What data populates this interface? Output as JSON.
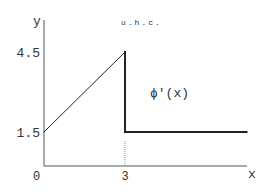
{
  "chart_data": {
    "type": "line",
    "title": "",
    "xlabel": "x",
    "ylabel": "y",
    "annotation_top": "u.h.c.",
    "series_label": "ϕ′(x)",
    "x_ticks": [
      {
        "value": 0,
        "label": "0"
      },
      {
        "value": 3,
        "label": "3"
      }
    ],
    "y_ticks": [
      {
        "value": 1.5,
        "label": "1.5"
      },
      {
        "value": 4.5,
        "label": "4.5"
      }
    ],
    "segments": [
      {
        "name": "ramp",
        "points": [
          [
            0,
            1.5
          ],
          [
            3,
            4.5
          ]
        ],
        "weight": "thin"
      },
      {
        "name": "drop",
        "points": [
          [
            3,
            4.5
          ],
          [
            3,
            1.5
          ]
        ],
        "weight": "thick"
      },
      {
        "name": "flat",
        "points": [
          [
            3,
            1.5
          ],
          [
            7.5,
            1.5
          ]
        ],
        "weight": "thick"
      }
    ],
    "guide_line": {
      "x": 3,
      "from_y": 1.5,
      "to_y": 0,
      "style": "dotted"
    },
    "xlim": [
      0,
      8.1
    ],
    "ylim": [
      0,
      6.0
    ],
    "grid": false
  }
}
